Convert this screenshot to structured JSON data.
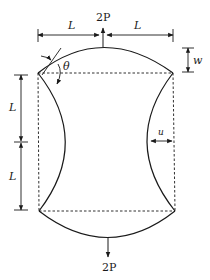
{
  "diagram": {
    "type": "mechanics-deformed-frame",
    "labels": {
      "top_load": "2P",
      "bottom_load": "2P",
      "top_left_span": "L",
      "top_right_span": "L",
      "left_upper_span": "L",
      "left_lower_span": "L",
      "vertical_deflection": "w",
      "horizontal_deflection": "u",
      "rotation_angle": "θ"
    },
    "colors": {
      "stroke": "#1a1a1a",
      "dashed": "#1a1a1a",
      "background": "#ffffff"
    }
  }
}
